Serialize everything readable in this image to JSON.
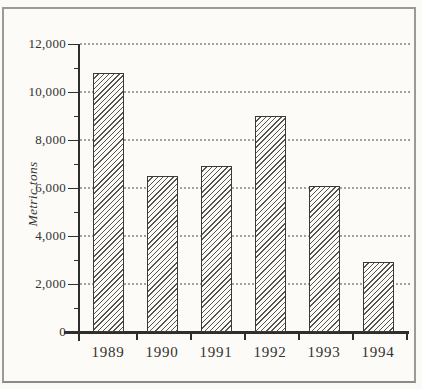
{
  "chart_data": {
    "type": "bar",
    "title": "",
    "categories": [
      "1989",
      "1990",
      "1991",
      "1992",
      "1993",
      "1994"
    ],
    "values": [
      10800,
      6500,
      6900,
      9000,
      6100,
      2900
    ],
    "xlabel": "",
    "ylabel": "Metric tons",
    "ylim": [
      0,
      12000
    ],
    "y_major_ticks": [
      0,
      2000,
      4000,
      6000,
      8000,
      10000,
      12000
    ],
    "y_tick_labels": [
      "0",
      "2,000",
      "4,000",
      "6,000",
      "8,000",
      "10,000",
      "12,000"
    ],
    "y_minor_tick_step": 1000,
    "grid": "horizontal-dotted",
    "legend": "none",
    "bar_style": "diagonal-hatch",
    "colors": {
      "background": "#fcfbf8",
      "frame_border": "#9a9a99",
      "axis": "#2f2e2c",
      "grid": "#a3a29e",
      "hatch": "#57554f",
      "bar_edge": "#3a3936",
      "text": "#33322f"
    }
  }
}
